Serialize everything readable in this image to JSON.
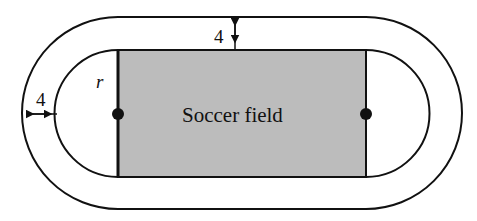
{
  "diagram": {
    "field_label": "Soccer field",
    "radius_label": "r",
    "track_width_top_label": "4",
    "track_width_left_label": "4",
    "colors": {
      "field_fill": "#bcbcbc",
      "stroke": "#111111",
      "background": "#ffffff"
    }
  }
}
